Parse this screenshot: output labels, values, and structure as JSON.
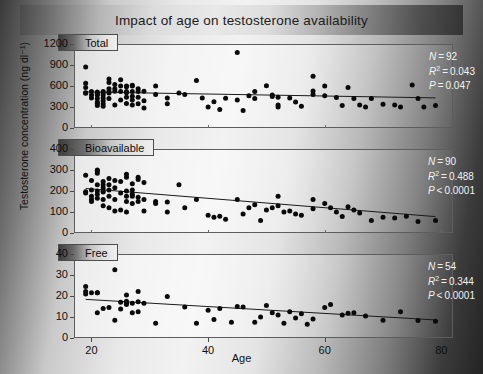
{
  "figure": {
    "title": "Impact of age on testosterone availability",
    "xlabel": "Age",
    "ylabel": "Testosterone concentration (ng dl⁻¹)"
  },
  "chart_data": {
    "type": "scatter",
    "title": "Impact of age on testosterone availability",
    "xlabel": "Age",
    "ylabel": "Testosterone concentration (ng dl⁻¹)",
    "xlim": [
      17,
      82
    ],
    "xticks": [
      20,
      40,
      60,
      80
    ],
    "grid": false,
    "legend": "none",
    "panels": [
      {
        "label": "Total",
        "ylim": [
          0,
          1200
        ],
        "yticks": [
          0,
          300,
          600,
          900,
          1200
        ],
        "stats": {
          "n_label": "N",
          "n_value": "92",
          "r2_label": "R",
          "r2_value": "0.043",
          "p_label": "P",
          "p_value": "0.047",
          "p_rel": "="
        },
        "fit_line": {
          "x0": 19,
          "y0": 515,
          "x1": 79,
          "y1": 430
        },
        "points": [
          [
            19,
            870
          ],
          [
            19,
            640
          ],
          [
            19,
            580
          ],
          [
            19,
            505
          ],
          [
            19,
            495
          ],
          [
            20,
            520
          ],
          [
            20,
            470
          ],
          [
            20,
            430
          ],
          [
            21,
            515
          ],
          [
            21,
            500
          ],
          [
            21,
            485
          ],
          [
            21,
            470
          ],
          [
            21,
            420
          ],
          [
            21,
            370
          ],
          [
            21,
            350
          ],
          [
            21,
            320
          ],
          [
            22,
            520
          ],
          [
            22,
            505
          ],
          [
            22,
            470
          ],
          [
            22,
            430
          ],
          [
            22,
            390
          ],
          [
            22,
            345
          ],
          [
            22,
            310
          ],
          [
            23,
            700
          ],
          [
            23,
            650
          ],
          [
            23,
            560
          ],
          [
            23,
            520
          ],
          [
            23,
            500
          ],
          [
            23,
            420
          ],
          [
            24,
            620
          ],
          [
            24,
            560
          ],
          [
            24,
            525
          ],
          [
            24,
            330
          ],
          [
            25,
            690
          ],
          [
            25,
            600
          ],
          [
            25,
            520
          ],
          [
            25,
            400
          ],
          [
            26,
            600
          ],
          [
            26,
            590
          ],
          [
            26,
            520
          ],
          [
            26,
            505
          ],
          [
            26,
            440
          ],
          [
            26,
            350
          ],
          [
            27,
            610
          ],
          [
            27,
            600
          ],
          [
            27,
            520
          ],
          [
            27,
            455
          ],
          [
            27,
            400
          ],
          [
            27,
            330
          ],
          [
            28,
            560
          ],
          [
            28,
            520
          ],
          [
            28,
            440
          ],
          [
            28,
            345
          ],
          [
            29,
            525
          ],
          [
            29,
            390
          ],
          [
            29,
            285
          ],
          [
            31,
            600
          ],
          [
            31,
            480
          ],
          [
            33,
            430
          ],
          [
            33,
            345
          ],
          [
            35,
            500
          ],
          [
            36,
            480
          ],
          [
            38,
            680
          ],
          [
            39,
            430
          ],
          [
            40,
            300
          ],
          [
            41,
            375
          ],
          [
            42,
            265
          ],
          [
            43,
            425
          ],
          [
            45,
            1080
          ],
          [
            45,
            400
          ],
          [
            46,
            250
          ],
          [
            47,
            460
          ],
          [
            48,
            520
          ],
          [
            48,
            420
          ],
          [
            50,
            605
          ],
          [
            51,
            470
          ],
          [
            51,
            450
          ],
          [
            52,
            440
          ],
          [
            52,
            330
          ],
          [
            52,
            300
          ],
          [
            54,
            430
          ],
          [
            55,
            370
          ],
          [
            56,
            310
          ],
          [
            58,
            530
          ],
          [
            58,
            480
          ],
          [
            58,
            740
          ],
          [
            60,
            600
          ],
          [
            60,
            460
          ],
          [
            62,
            435
          ],
          [
            63,
            320
          ],
          [
            64,
            580
          ],
          [
            65,
            420
          ],
          [
            66,
            330
          ],
          [
            67,
            300
          ],
          [
            68,
            420
          ],
          [
            70,
            340
          ],
          [
            72,
            330
          ],
          [
            73,
            300
          ],
          [
            75,
            615
          ],
          [
            76,
            420
          ],
          [
            77,
            300
          ],
          [
            79,
            320
          ]
        ]
      },
      {
        "label": "Bioavailable",
        "ylim": [
          0,
          400
        ],
        "yticks": [
          0,
          100,
          200,
          300,
          400
        ],
        "stats": {
          "n_label": "N",
          "n_value": "90",
          "r2_label": "R",
          "r2_value": "0.488",
          "p_label": "P",
          "p_value": "0.0001",
          "p_rel": "<"
        },
        "fit_line": {
          "x0": 19,
          "y0": 212,
          "x1": 79,
          "y1": 78
        },
        "points": [
          [
            19,
            275
          ],
          [
            19,
            196
          ],
          [
            19,
            190
          ],
          [
            20,
            250
          ],
          [
            20,
            205
          ],
          [
            20,
            175
          ],
          [
            20,
            160
          ],
          [
            20,
            150
          ],
          [
            21,
            300
          ],
          [
            21,
            295
          ],
          [
            21,
            285
          ],
          [
            21,
            230
          ],
          [
            21,
            200
          ],
          [
            21,
            185
          ],
          [
            21,
            165
          ],
          [
            22,
            245
          ],
          [
            22,
            230
          ],
          [
            22,
            215
          ],
          [
            22,
            200
          ],
          [
            22,
            195
          ],
          [
            22,
            160
          ],
          [
            22,
            130
          ],
          [
            23,
            260
          ],
          [
            23,
            230
          ],
          [
            23,
            205
          ],
          [
            23,
            175
          ],
          [
            23,
            120
          ],
          [
            24,
            250
          ],
          [
            24,
            215
          ],
          [
            24,
            160
          ],
          [
            24,
            105
          ],
          [
            25,
            245
          ],
          [
            25,
            190
          ],
          [
            25,
            110
          ],
          [
            26,
            280
          ],
          [
            26,
            265
          ],
          [
            26,
            200
          ],
          [
            26,
            175
          ],
          [
            26,
            150
          ],
          [
            26,
            100
          ],
          [
            27,
            235
          ],
          [
            27,
            205
          ],
          [
            27,
            185
          ],
          [
            27,
            175
          ],
          [
            27,
            140
          ],
          [
            28,
            265
          ],
          [
            28,
            255
          ],
          [
            28,
            170
          ],
          [
            28,
            150
          ],
          [
            29,
            240
          ],
          [
            29,
            160
          ],
          [
            29,
            105
          ],
          [
            31,
            150
          ],
          [
            31,
            140
          ],
          [
            33,
            148
          ],
          [
            33,
            100
          ],
          [
            35,
            230
          ],
          [
            36,
            120
          ],
          [
            38,
            160
          ],
          [
            40,
            85
          ],
          [
            41,
            75
          ],
          [
            42,
            80
          ],
          [
            43,
            65
          ],
          [
            45,
            160
          ],
          [
            46,
            90
          ],
          [
            47,
            120
          ],
          [
            48,
            135
          ],
          [
            49,
            60
          ],
          [
            50,
            110
          ],
          [
            51,
            120
          ],
          [
            52,
            175
          ],
          [
            52,
            130
          ],
          [
            53,
            100
          ],
          [
            54,
            105
          ],
          [
            55,
            90
          ],
          [
            56,
            85
          ],
          [
            58,
            160
          ],
          [
            58,
            115
          ],
          [
            60,
            140
          ],
          [
            61,
            120
          ],
          [
            62,
            100
          ],
          [
            63,
            78
          ],
          [
            64,
            125
          ],
          [
            65,
            110
          ],
          [
            66,
            95
          ],
          [
            68,
            60
          ],
          [
            70,
            75
          ],
          [
            72,
            72
          ],
          [
            74,
            80
          ],
          [
            76,
            55
          ],
          [
            79,
            60
          ]
        ]
      },
      {
        "label": "Free",
        "ylim": [
          0,
          40
        ],
        "yticks": [
          0,
          10,
          20,
          30,
          40
        ],
        "stats": {
          "n_label": "N",
          "n_value": "54",
          "r2_label": "R",
          "r2_value": "0.344",
          "p_label": "P",
          "p_value": "0.0001",
          "p_rel": "<"
        },
        "fit_line": {
          "x0": 19,
          "y0": 18.4,
          "x1": 79,
          "y1": 8.6
        },
        "points": [
          [
            19,
            24.5
          ],
          [
            19,
            22.2
          ],
          [
            19,
            21.0
          ],
          [
            20,
            21.5
          ],
          [
            21,
            21.6
          ],
          [
            21,
            21.5
          ],
          [
            21,
            12.0
          ],
          [
            22,
            14.0
          ],
          [
            23,
            14.5
          ],
          [
            24,
            32.5
          ],
          [
            24,
            8.5
          ],
          [
            25,
            13.8
          ],
          [
            25,
            17.0
          ],
          [
            26,
            20.5
          ],
          [
            26,
            17.5
          ],
          [
            26,
            16.8
          ],
          [
            26,
            16.0
          ],
          [
            27,
            16.5
          ],
          [
            27,
            12.0
          ],
          [
            28,
            22.2
          ],
          [
            28,
            17.3
          ],
          [
            28,
            12.5
          ],
          [
            29,
            16.5
          ],
          [
            31,
            7.0
          ],
          [
            33,
            19.8
          ],
          [
            36,
            14.8
          ],
          [
            38,
            7.0
          ],
          [
            40,
            13.2
          ],
          [
            41,
            8.8
          ],
          [
            42,
            14.0
          ],
          [
            44,
            7.5
          ],
          [
            45,
            15.0
          ],
          [
            46,
            14.8
          ],
          [
            48,
            7.5
          ],
          [
            49,
            10.0
          ],
          [
            50,
            15.5
          ],
          [
            51,
            12.0
          ],
          [
            52,
            11.0
          ],
          [
            53,
            7.0
          ],
          [
            54,
            12.5
          ],
          [
            55,
            9.5
          ],
          [
            56,
            11.5
          ],
          [
            57,
            6.5
          ],
          [
            58,
            9.0
          ],
          [
            60,
            14.5
          ],
          [
            61,
            16.0
          ],
          [
            63,
            11.0
          ],
          [
            64,
            11.8
          ],
          [
            65,
            12.0
          ],
          [
            67,
            10.5
          ],
          [
            70,
            8.5
          ],
          [
            73,
            12.5
          ],
          [
            76,
            8.3
          ],
          [
            79,
            8.0
          ]
        ]
      }
    ]
  }
}
